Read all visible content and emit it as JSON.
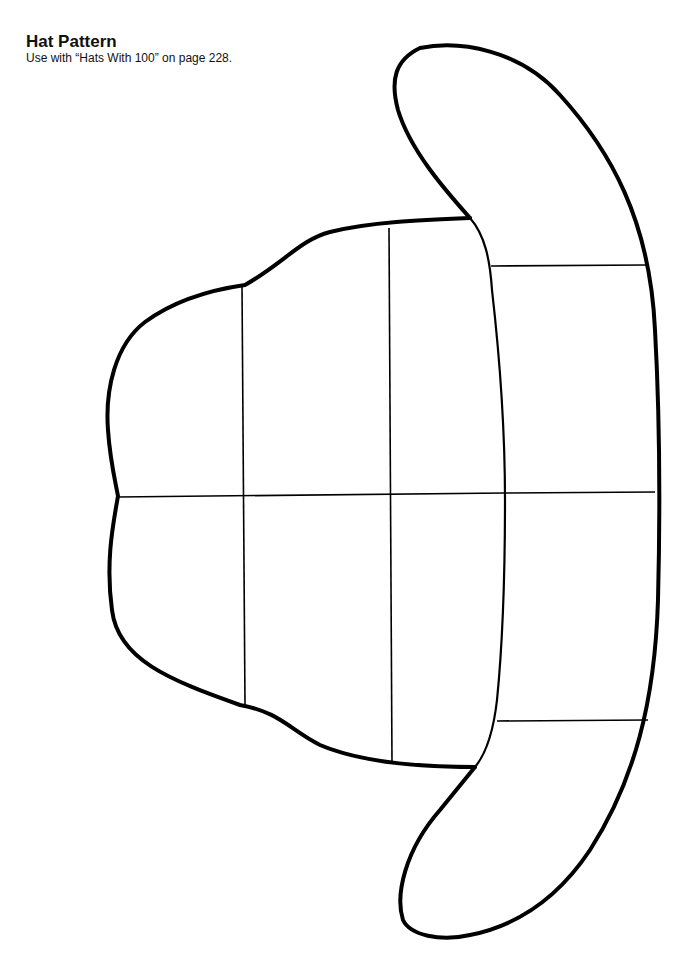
{
  "header": {
    "title": "Hat Pattern",
    "subtitle": "Use with “Hats With 100” on page 228."
  },
  "pattern": {
    "name": "hat-template",
    "stroke_color": "#000000",
    "background": "#ffffff",
    "pieces": [
      "crown",
      "brim"
    ],
    "crown_grid": {
      "columns": 3,
      "rows": 2
    },
    "brim_sections": 3
  }
}
